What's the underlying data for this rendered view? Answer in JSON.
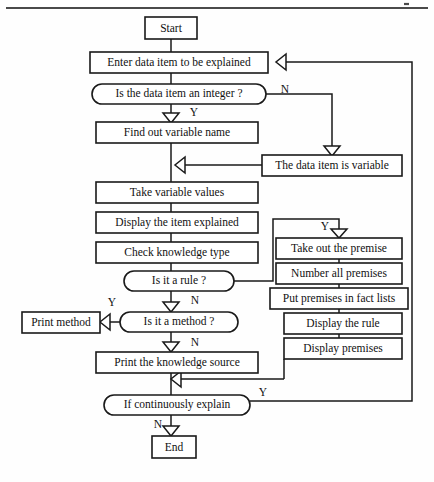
{
  "page": {
    "background_color": "#fefefe",
    "line_color": "#1a1a1a",
    "header_rule_color": "#4a4a4a",
    "width": 434,
    "height": 482
  },
  "diagram": {
    "type": "flowchart",
    "orientation": "top-to-bottom",
    "nodes": [
      {
        "id": "start",
        "label": "Start",
        "shape": "rect",
        "x": 145,
        "y": 17,
        "w": 52,
        "h": 22
      },
      {
        "id": "enter_data",
        "label": "Enter data item to be explained",
        "shape": "rect",
        "x": 90,
        "y": 52,
        "w": 178,
        "h": 21
      },
      {
        "id": "is_integer",
        "label": "Is the data item an integer ?",
        "shape": "stadium",
        "x": 92,
        "y": 84,
        "w": 174,
        "h": 20
      },
      {
        "id": "find_var",
        "label": "Find out variable name",
        "shape": "rect",
        "x": 96,
        "y": 122,
        "w": 162,
        "h": 21
      },
      {
        "id": "item_is_variable",
        "label": "The data item is variable",
        "shape": "rect",
        "x": 262,
        "y": 155,
        "w": 140,
        "h": 21
      },
      {
        "id": "take_values",
        "label": "Take variable values",
        "shape": "rect",
        "x": 96,
        "y": 182,
        "w": 162,
        "h": 21
      },
      {
        "id": "display_item",
        "label": "Display the item explained",
        "shape": "rect",
        "x": 96,
        "y": 212,
        "w": 162,
        "h": 21
      },
      {
        "id": "check_knowledge",
        "label": "Check knowledge type",
        "shape": "rect",
        "x": 96,
        "y": 242,
        "w": 162,
        "h": 21
      },
      {
        "id": "is_rule",
        "label": "Is it a rule ?",
        "shape": "stadium",
        "x": 124,
        "y": 271,
        "w": 110,
        "h": 20
      },
      {
        "id": "print_method",
        "label": "Print method",
        "shape": "rect",
        "x": 22,
        "y": 312,
        "w": 78,
        "h": 21
      },
      {
        "id": "is_method",
        "label": "Is it a method ?",
        "shape": "stadium",
        "x": 120,
        "y": 312,
        "w": 118,
        "h": 20
      },
      {
        "id": "print_source",
        "label": "Print the knowledge source",
        "shape": "rect",
        "x": 96,
        "y": 352,
        "w": 162,
        "h": 21
      },
      {
        "id": "if_continuously",
        "label": "If continuously explain",
        "shape": "stadium",
        "x": 104,
        "y": 395,
        "w": 146,
        "h": 20
      },
      {
        "id": "end",
        "label": "End",
        "shape": "rect",
        "x": 152,
        "y": 436,
        "w": 44,
        "h": 22
      },
      {
        "id": "take_premise",
        "label": "Take out the premise",
        "shape": "rect",
        "x": 276,
        "y": 238,
        "w": 126,
        "h": 21
      },
      {
        "id": "number_premises",
        "label": "Number all premises",
        "shape": "rect",
        "x": 276,
        "y": 263,
        "w": 126,
        "h": 21
      },
      {
        "id": "put_premises",
        "label": "Put premises in fact lists",
        "shape": "rect",
        "x": 270,
        "y": 288,
        "w": 138,
        "h": 21
      },
      {
        "id": "display_rule",
        "label": "Display the rule",
        "shape": "rect",
        "x": 284,
        "y": 313,
        "w": 118,
        "h": 21
      },
      {
        "id": "display_premises",
        "label": "Display premises",
        "shape": "rect",
        "x": 284,
        "y": 338,
        "w": 118,
        "h": 21
      }
    ],
    "edge_labels": [
      {
        "id": "lbl_integer_n",
        "text": "N",
        "x": 285,
        "y": 90
      },
      {
        "id": "lbl_integer_y",
        "text": "Y",
        "x": 194,
        "y": 113
      },
      {
        "id": "lbl_rule_y",
        "text": "Y",
        "x": 325,
        "y": 227
      },
      {
        "id": "lbl_rule_n",
        "text": "N",
        "x": 195,
        "y": 301
      },
      {
        "id": "lbl_method_y",
        "text": "Y",
        "x": 112,
        "y": 303
      },
      {
        "id": "lbl_method_n",
        "text": "N",
        "x": 195,
        "y": 343
      },
      {
        "id": "lbl_cont_y",
        "text": "Y",
        "x": 263,
        "y": 393
      },
      {
        "id": "lbl_cont_n",
        "text": "N",
        "x": 158,
        "y": 425
      }
    ]
  }
}
